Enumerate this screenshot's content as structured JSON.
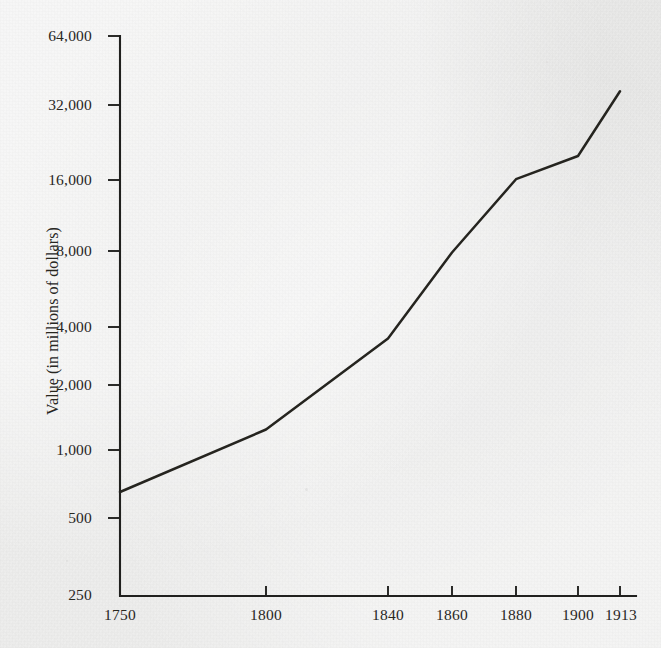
{
  "figure": {
    "background_color": "#ececeb",
    "ink_color": "#25241f"
  },
  "axes": {
    "y_title": "Value (in millions of dollars)",
    "x_title": "",
    "y_tick_labels": [
      "64,000",
      "32,000",
      "16,000",
      "8,000",
      "4,000",
      "2,000",
      "1,000",
      "500",
      "250"
    ],
    "x_tick_labels": [
      "1750",
      "1800",
      "1840",
      "1860",
      "1880",
      "1900",
      "1913"
    ]
  },
  "chart_data": {
    "type": "line",
    "title": "",
    "xlabel": "",
    "ylabel": "Value (in millions of dollars)",
    "yscale": "log",
    "ylim": [
      250,
      64000
    ],
    "y_ticks": [
      250,
      500,
      1000,
      2000,
      4000,
      8000,
      16000,
      32000,
      64000
    ],
    "y_tick_labels": [
      "250",
      "500",
      "1,000",
      "2,000",
      "4,000",
      "8,000",
      "16,000",
      "32,000",
      "64,000"
    ],
    "x": [
      1750,
      1800,
      1840,
      1860,
      1880,
      1900,
      1913
    ],
    "x_tick_labels": [
      "1750",
      "1800",
      "1840",
      "1860",
      "1880",
      "1900",
      "1913"
    ],
    "x_positions_px": [
      120,
      266,
      388,
      452,
      516,
      578,
      620
    ],
    "values": [
      700,
      1300,
      3200,
      7500,
      15500,
      19500,
      37000
    ],
    "series": [
      {
        "name": "Value (in millions of dollars)",
        "values": [
          700,
          1300,
          3200,
          7500,
          15500,
          19500,
          37000
        ]
      }
    ],
    "grid": false,
    "legend": false,
    "legend_position": "none",
    "markers": false,
    "line_color": "#25241f"
  }
}
